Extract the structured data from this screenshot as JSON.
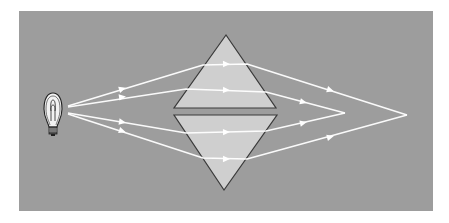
{
  "figure": {
    "colors": {
      "page_background": "#ffffff",
      "panel_background": "#9d9d9d",
      "prism_fill": "#cfcfcf",
      "prism_edge": "#3a3a3a",
      "ray": "#ffffff",
      "bulb_outline": "#222222",
      "bulb_glass": "#f2f2f2"
    },
    "panel": {
      "x": 19,
      "y": 11,
      "width": 414,
      "height": 200
    },
    "bulb": {
      "cx": 53,
      "cy": 113,
      "label": "light-bulb"
    },
    "prisms": [
      {
        "name": "upper-prism",
        "points": "226,35 174,108 276,108"
      },
      {
        "name": "lower-prism",
        "points": "174,115 277,115 224,190"
      }
    ],
    "rays": [
      {
        "name": "ray-outer-top",
        "points": "68,106 203,65 247,64 407,115",
        "arrows": [
          [
            122,
            89
          ],
          [
            226,
            64
          ],
          [
            330,
            90
          ]
        ]
      },
      {
        "name": "ray-inner-top",
        "points": "68,107 186,89 266,92 345,113",
        "arrows": [
          [
            122,
            97
          ],
          [
            226,
            90
          ],
          [
            303,
            102
          ]
        ]
      },
      {
        "name": "ray-inner-bottom",
        "points": "68,113 186,133 266,131 345,113",
        "arrows": [
          [
            122,
            122
          ],
          [
            226,
            132
          ],
          [
            303,
            123
          ]
        ]
      },
      {
        "name": "ray-outer-bottom",
        "points": "68,114 203,158 247,159 407,115",
        "arrows": [
          [
            122,
            131
          ],
          [
            226,
            159
          ],
          [
            330,
            137
          ]
        ]
      }
    ],
    "focal_points": [
      {
        "name": "inner-focus",
        "x": 345,
        "y": 113
      },
      {
        "name": "outer-focus",
        "x": 407,
        "y": 115
      }
    ]
  }
}
